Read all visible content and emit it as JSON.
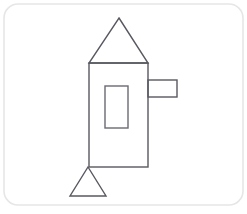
{
  "canvas": {
    "width": 247,
    "height": 214,
    "background_color": "#ffffff",
    "border": {
      "name": "rounded-frame",
      "x": 4,
      "y": 4,
      "width": 239,
      "height": 201,
      "corner_radius": 14,
      "stroke_color": "#e6e6e6",
      "stroke_width": 1.6,
      "fill": "none"
    }
  },
  "drawing": {
    "title": "line-drawing-rocket-house",
    "stroke_color": "#585860",
    "stroke_width": 1.4,
    "fill": "none",
    "shapes": [
      {
        "name": "roof-triangle",
        "type": "triangle",
        "points": "119,18 148,63 89,63",
        "apex": {
          "x": 119,
          "y": 18
        },
        "base_left": {
          "x": 89,
          "y": 63
        },
        "base_right": {
          "x": 148,
          "y": 63
        },
        "stroke_color": "#585860"
      },
      {
        "name": "body-rectangle",
        "type": "rect",
        "x": 89,
        "y": 63,
        "width": 59,
        "height": 104,
        "stroke_color": "#585860"
      },
      {
        "name": "side-arm-rectangle",
        "type": "rect",
        "x": 148,
        "y": 80,
        "width": 29,
        "height": 17,
        "stroke_color": "#585860"
      },
      {
        "name": "window-rectangle",
        "type": "rect",
        "x": 105,
        "y": 86,
        "width": 23,
        "height": 42,
        "stroke_color": "#6a6a72"
      },
      {
        "name": "base-triangle",
        "type": "triangle",
        "points": "88,167 106,196 70,196",
        "apex": {
          "x": 88,
          "y": 167
        },
        "base_left": {
          "x": 70,
          "y": 196
        },
        "base_right": {
          "x": 106,
          "y": 196
        },
        "stroke_color": "#585860"
      }
    ]
  }
}
